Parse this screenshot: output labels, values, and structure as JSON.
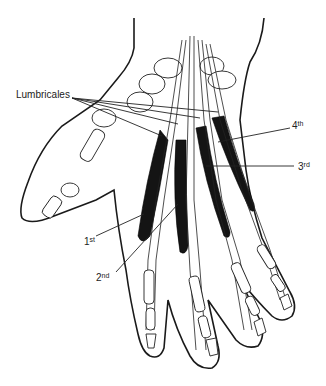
{
  "figure": {
    "colors": {
      "line": "#1a1a1a",
      "muscle": "#141414",
      "background": "#ffffff"
    }
  },
  "labels": {
    "group": "Lumbricales",
    "first": {
      "num": "1",
      "suffix": "st"
    },
    "second": {
      "num": "2",
      "suffix": "nd"
    },
    "third": {
      "num": "3",
      "suffix": "rd"
    },
    "fourth": {
      "num": "4",
      "suffix": "th"
    }
  }
}
